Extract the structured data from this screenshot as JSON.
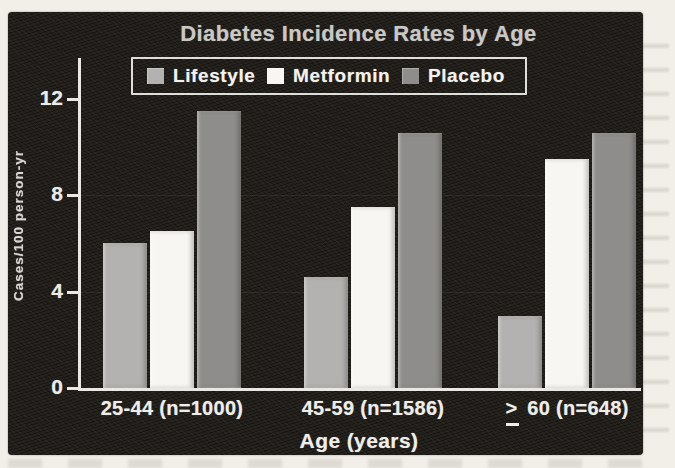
{
  "colors": {
    "page_bg": "#f1efe8",
    "panel_bg": "#23201c",
    "axis": "#e9e8e4",
    "title_text": "#c9c8c5",
    "tick_text": "#ecebe7"
  },
  "chart_data": {
    "type": "bar",
    "title": "Diabetes Incidence Rates by Age",
    "xlabel": "Age (years)",
    "ylabel": "Cases/100 person-yr",
    "ylim": [
      0,
      12
    ],
    "yticks": [
      0,
      4,
      8,
      12
    ],
    "grid": false,
    "legend_position": "top-inside",
    "categories": [
      {
        "prefix": "",
        "label": "25-44 (n=1000)"
      },
      {
        "prefix": "",
        "label": "45-59 (n=1586)"
      },
      {
        "prefix": ">",
        "prefix_underlined": true,
        "label": "60 (n=648)"
      }
    ],
    "series": [
      {
        "name": "Lifestyle",
        "color": "#b3b2b0",
        "values": [
          6.0,
          4.6,
          3.0
        ]
      },
      {
        "name": "Metformin",
        "color": "#f7f6f3",
        "values": [
          6.5,
          7.5,
          9.5
        ]
      },
      {
        "name": "Placebo",
        "color": "#8e8d8b",
        "values": [
          11.5,
          10.6,
          10.6
        ]
      }
    ]
  }
}
